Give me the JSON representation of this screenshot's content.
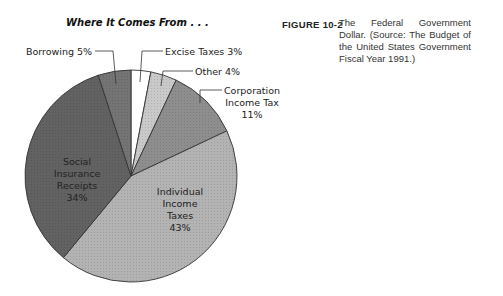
{
  "figure": {
    "label": "FIGURE 10-2",
    "caption": "The Federal Government Dollar. (Source: The Budget of the United States Government Fiscal Year 1991.)"
  },
  "chart_data": {
    "type": "pie",
    "title": "Where It Comes From . . .",
    "start": "top",
    "direction": "clockwise",
    "slices": [
      {
        "name": "Excise Taxes",
        "value": 3,
        "label": "Excise Taxes 3%",
        "color": "#ffffff",
        "label_position": "outside"
      },
      {
        "name": "Other",
        "value": 4,
        "label": "Other 4%",
        "color": "#c9c9c9",
        "label_position": "outside"
      },
      {
        "name": "Corporation Income Tax",
        "value": 11,
        "label_lines": [
          "Corporation",
          "Income Tax",
          "11%"
        ],
        "color": "#8e8e8e",
        "label_position": "outside"
      },
      {
        "name": "Individual Income Taxes",
        "value": 43,
        "label_lines": [
          "Individual",
          "Income",
          "Taxes",
          "43%"
        ],
        "color": "#b3b3b3",
        "label_position": "inside"
      },
      {
        "name": "Social Insurance Receipts",
        "value": 34,
        "label_lines": [
          "Social",
          "Insurance",
          "Receipts",
          "34%"
        ],
        "color": "#626262",
        "label_position": "inside"
      },
      {
        "name": "Borrowing",
        "value": 5,
        "label": "Borrowing 5%",
        "color": "#747474",
        "label_position": "outside"
      }
    ],
    "unit": "%"
  }
}
